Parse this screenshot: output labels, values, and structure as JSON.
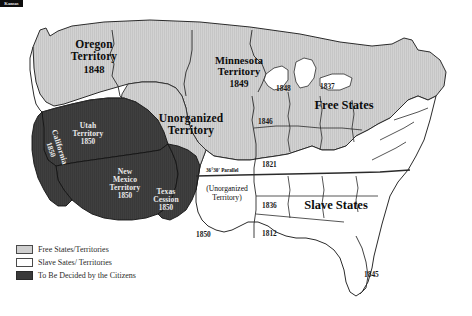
{
  "map": {
    "title": "United States 1850 Compromise Map",
    "colors": {
      "free_fill": "#cfcfcf",
      "slave_fill": "#ffffff",
      "undecided_fill": "#3f3f3f",
      "outline": "#2a2a2a",
      "background": "#ffffff"
    },
    "territories": [
      {
        "name": "Oregon\nTerritory",
        "line1": "Oregon",
        "line2": "Territory",
        "year": "1848"
      },
      {
        "name": "Minnesota Territory",
        "line1": "Minnesota",
        "line2": "Territory",
        "year": "1849"
      },
      {
        "name": "Unorganized Territory",
        "line1": "Unorganized",
        "line2": "Territory",
        "year": ""
      },
      {
        "name": "Utah Territory",
        "line1": "Utah",
        "line2": "Territory",
        "year": "1850"
      },
      {
        "name": "New Mexico Territory",
        "line1": "New",
        "line2": "Mexico",
        "line3": "Territory",
        "year": "1850"
      },
      {
        "name": "Texas Cession",
        "line1": "Texas",
        "line2": "Cession",
        "year": "1850"
      },
      {
        "name": "California",
        "line1": "California",
        "year": "1850"
      }
    ],
    "region_labels": {
      "free_states": "Free States",
      "slave_states": "Slave States"
    },
    "parallel_label": "36°30' Parallel",
    "unorganized_inset": {
      "line1": "(Unorganized",
      "line2": "Territory)"
    },
    "kansas_box_label": "Kansas",
    "texas_year": "1850",
    "statehood_dates": [
      {
        "state": "Wisconsin",
        "year": "1848"
      },
      {
        "state": "Michigan",
        "year": "1837"
      },
      {
        "state": "Iowa",
        "year": "1846"
      },
      {
        "state": "Missouri",
        "year": "1821"
      },
      {
        "state": "Arkansas",
        "year": "1836"
      },
      {
        "state": "Louisiana",
        "year": "1812"
      },
      {
        "state": "Florida",
        "year": "1845"
      }
    ]
  },
  "legend": {
    "items": [
      {
        "label": "Free States/Territories",
        "swatch": "free"
      },
      {
        "label": "Slave Sates/ Territories",
        "swatch": "slave"
      },
      {
        "label": "To Be Decided by the Citizens",
        "swatch": "undecided"
      }
    ]
  }
}
